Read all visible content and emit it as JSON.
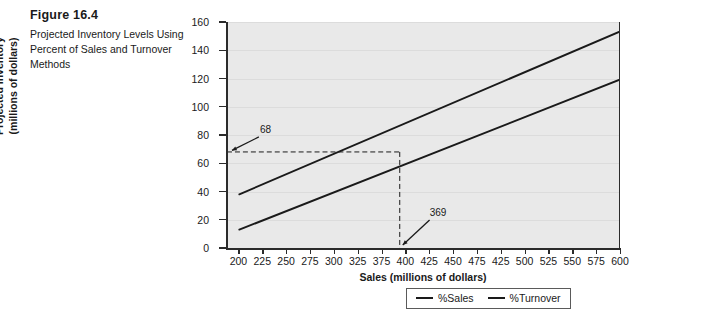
{
  "caption": {
    "title": "Figure 16.4",
    "description": "Projected Inventory Levels Using Percent of Sales and Turnover Methods"
  },
  "chart_data": {
    "type": "line",
    "title": "",
    "xlabel": "Sales (millions of dollars)",
    "ylabel": "Projected Inventory (millions of dollars)",
    "ylabel_line1": "Projected Inventory",
    "ylabel_line2": "(millions of dollars)",
    "xlim": [
      187,
      600
    ],
    "ylim": [
      0,
      160
    ],
    "yticks": [
      0,
      20,
      40,
      60,
      80,
      100,
      120,
      140,
      160
    ],
    "xticks": [
      200,
      225,
      250,
      275,
      300,
      325,
      350,
      375,
      400,
      425,
      450,
      475,
      500,
      525,
      550,
      575,
      600
    ],
    "xtick_labels": [
      "200",
      "225",
      "250",
      "275",
      "300",
      "325",
      "375",
      "400",
      "425",
      "450",
      "475",
      "425",
      "500",
      "525",
      "550",
      "575",
      "600"
    ],
    "grid": "horizontal",
    "legend_position": "bottom-center",
    "series": [
      {
        "name": "%Sales",
        "x": [
          200,
          600
        ],
        "values": [
          38,
          153
        ]
      },
      {
        "name": "%Turnover",
        "x": [
          200,
          600
        ],
        "values": [
          13,
          119
        ]
      }
    ],
    "annotations": [
      {
        "label": "68",
        "x": 200,
        "y": 68,
        "kind": "y-intercept-marker"
      },
      {
        "label": "369",
        "x": 369,
        "y": 0,
        "kind": "x-intercept-marker"
      }
    ],
    "intersection": {
      "x": 369,
      "y": 68
    },
    "guide_lines": [
      {
        "orientation": "horizontal",
        "value": 68,
        "style": "dashed"
      },
      {
        "orientation": "vertical",
        "value": 369,
        "style": "dashed"
      }
    ]
  },
  "legend": {
    "items": [
      {
        "label": "%Sales"
      },
      {
        "label": "%Turnover"
      }
    ]
  },
  "colors": {
    "plot_background": "#e9e9e9",
    "line": "#1a1a1a",
    "gridline": "#dcdcdc",
    "axis": "#2b2b2b"
  }
}
